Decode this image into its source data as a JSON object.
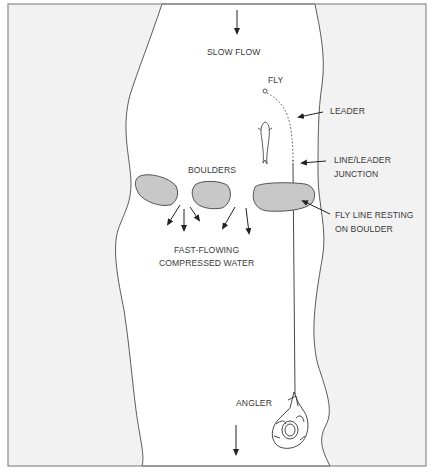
{
  "diagram": {
    "colors": {
      "bank": "#f2f2f2",
      "water": "#ffffff",
      "boulder": "#c8c8c8",
      "line": "#333333",
      "border": "#8a8a8a",
      "text": "#3a3a3a"
    },
    "labels": {
      "slow_flow": "SLOW FLOW",
      "fly": "FLY",
      "leader": "LEADER",
      "junction_line1": "LINE/LEADER",
      "junction_line2": "JUNCTION",
      "boulders": "BOULDERS",
      "resting_line1": "FLY LINE RESTING",
      "resting_line2": "ON BOULDER",
      "fast_line1": "FAST-FLOWING",
      "fast_line2": "COMPRESSED WATER",
      "angler": "ANGLER"
    },
    "elements": {
      "flow_arrows": [
        "top-flow-arrow",
        "bottom-flow-arrow"
      ],
      "boulders": [
        "left-boulder",
        "middle-boulder",
        "right-boulder"
      ],
      "current_arrows": 5,
      "figures": [
        "trout",
        "angler-in-float-tube"
      ]
    }
  }
}
